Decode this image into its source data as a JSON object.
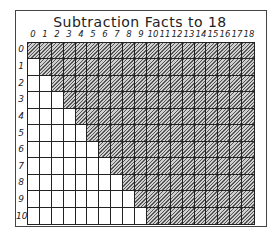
{
  "title": "Subtraction Facts to 18",
  "columns": [
    "0",
    "1",
    "2",
    "3",
    "4",
    "5",
    "6",
    "7",
    "8",
    "9",
    "10",
    "11",
    "12",
    "13",
    "14",
    "15",
    "16",
    "17",
    "18"
  ],
  "rows": [
    "0",
    "1",
    "2",
    "3",
    "4",
    "5",
    "6",
    "7",
    "8",
    "9",
    "10"
  ],
  "shading_rule": "cell shaded when column >= row",
  "colors": {
    "line": "#222222",
    "hatch_dark": "#555555",
    "hatch_light": "#d0d0d0",
    "background": "#ffffff"
  }
}
